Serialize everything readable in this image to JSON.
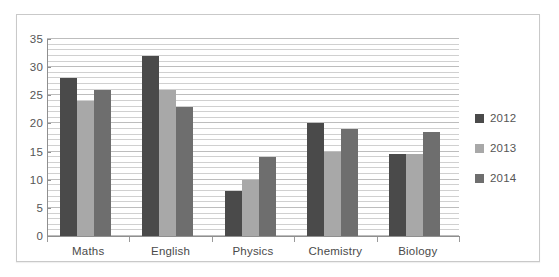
{
  "chart_data": {
    "type": "bar",
    "title": "",
    "subtitle": "",
    "xlabel": "",
    "ylabel": "",
    "categories": [
      "Maths",
      "English",
      "Physics",
      "Chemistry",
      "Biology"
    ],
    "series": [
      {
        "name": "2012",
        "color": "#4a4a4a",
        "values": [
          28,
          32,
          8,
          20,
          14.5
        ]
      },
      {
        "name": "2013",
        "color": "#a8a8a8",
        "values": [
          24,
          26,
          10,
          15,
          14.5
        ]
      },
      {
        "name": "2014",
        "color": "#6e6e6e",
        "values": [
          26,
          23,
          14,
          19,
          18.5
        ]
      }
    ],
    "ylim": [
      0,
      35
    ],
    "ytick_step": 5,
    "yticks": [
      "0",
      "5",
      "10",
      "15",
      "20",
      "25",
      "30",
      "35"
    ],
    "grid": true,
    "grid_minor_step": 1,
    "legend_position": "right",
    "legend_entries": [
      "2012",
      "2013",
      "2014"
    ]
  },
  "legend": {
    "items": [
      {
        "label": "2012",
        "color": "#4a4a4a"
      },
      {
        "label": "2013",
        "color": "#a8a8a8"
      },
      {
        "label": "2014",
        "color": "#6e6e6e"
      }
    ]
  }
}
